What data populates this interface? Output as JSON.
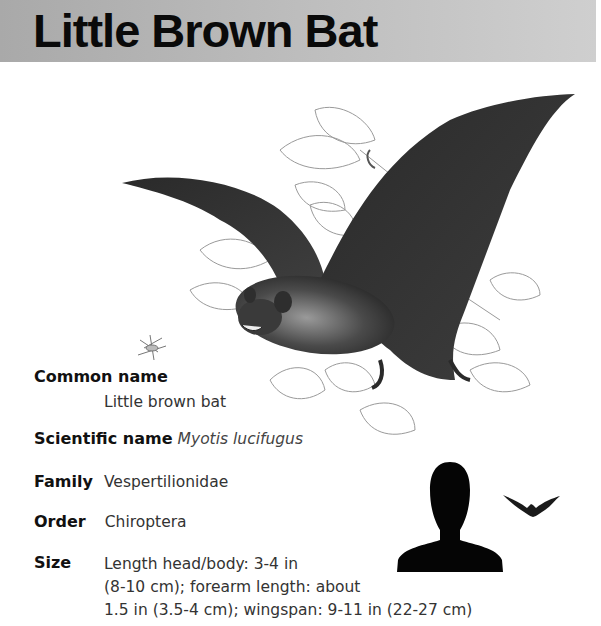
{
  "header": {
    "title": "Little Brown Bat",
    "background_gradient": [
      "#a9a9a9",
      "#cfcfcf"
    ]
  },
  "illustration": {
    "subject": "little brown bat in flight over sketched leaves",
    "insect": "small flying insect sketch"
  },
  "facts": {
    "common_name": {
      "label": "Common name",
      "value": "Little brown bat"
    },
    "scientific_name": {
      "label": "Scientific name",
      "value": "Myotis lucifugus"
    },
    "family": {
      "label": "Family",
      "value": "Vespertilionidae"
    },
    "order": {
      "label": "Order",
      "value": "Chiroptera"
    },
    "size": {
      "label": "Size",
      "lines": [
        "Length head/body: 3-4 in",
        "(8-10 cm); forearm length: about",
        "1.5 in (3.5-4 cm); wingspan: 9-11 in (22-27 cm)"
      ]
    }
  },
  "scale_comparison": {
    "human_icon": "human-silhouette",
    "bat_icon": "bat-silhouette"
  }
}
